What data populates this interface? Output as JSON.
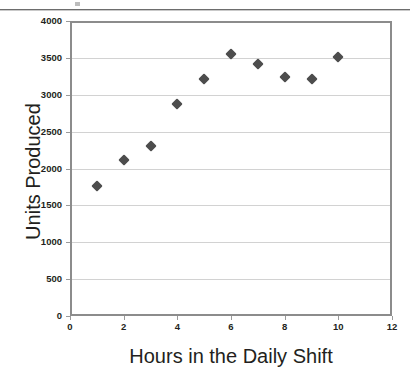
{
  "chart_data": {
    "type": "scatter",
    "title": "",
    "xlabel": "Hours in the Daily Shift",
    "ylabel": "Units Produced",
    "x": [
      1,
      2,
      3,
      4,
      5,
      6,
      7,
      8,
      9,
      10
    ],
    "values": [
      1760,
      2115,
      2310,
      2875,
      3215,
      3550,
      3420,
      3240,
      3210,
      3515
    ],
    "points": [
      {
        "x": 1,
        "y": 1760
      },
      {
        "x": 2,
        "y": 2115
      },
      {
        "x": 3,
        "y": 2310
      },
      {
        "x": 4,
        "y": 2875
      },
      {
        "x": 5,
        "y": 3215
      },
      {
        "x": 6,
        "y": 3550
      },
      {
        "x": 7,
        "y": 3420
      },
      {
        "x": 8,
        "y": 3240
      },
      {
        "x": 9,
        "y": 3210
      },
      {
        "x": 10,
        "y": 3515
      }
    ],
    "xlim": [
      0,
      12
    ],
    "ylim": [
      0,
      4000
    ],
    "xticks": [
      0,
      2,
      4,
      6,
      8,
      10,
      12
    ],
    "yticks": [
      0,
      500,
      1000,
      1500,
      2000,
      2500,
      3000,
      3500,
      4000
    ],
    "xtick_labels": [
      "0",
      "2",
      "4",
      "6",
      "8",
      "10",
      "12"
    ],
    "ytick_labels": [
      "0",
      "500",
      "1000",
      "1500",
      "2000",
      "2500",
      "3000",
      "3500",
      "4000"
    ],
    "grid": "horizontal",
    "legend": "none",
    "marker_shape": "diamond",
    "marker_color": "#4d4d4d",
    "gridline_color": "#d2d2d2",
    "axis_color": "#8c8c8c",
    "text_color": "#231f20",
    "background_color": "#ffffff"
  }
}
